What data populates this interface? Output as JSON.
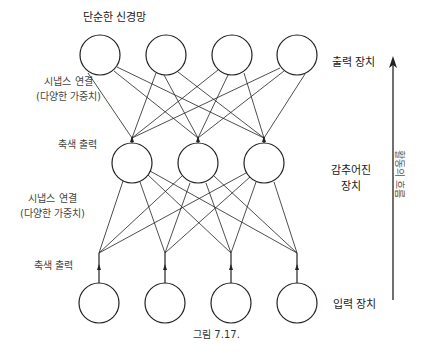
{
  "title": "단순한 신경망",
  "labels": {
    "synapse_top_line1": "시냅스 연결",
    "synapse_top_line2": "(다양한 가중치)",
    "axon_top": "축색 출력",
    "synapse_bottom_line1": "시냅스 연결",
    "synapse_bottom_line2": "(다양한 가중치)",
    "axon_bottom": "축색 출력"
  },
  "layers": {
    "output": {
      "label": "출력 장치",
      "count": 4
    },
    "hidden": {
      "label_line1": "감추어진",
      "label_line2": "장치",
      "count": 3
    },
    "input": {
      "label": "입력 장치",
      "count": 4
    }
  },
  "flow_arrow": {
    "label": "활동의 흐름"
  },
  "caption": "그림 7.17."
}
